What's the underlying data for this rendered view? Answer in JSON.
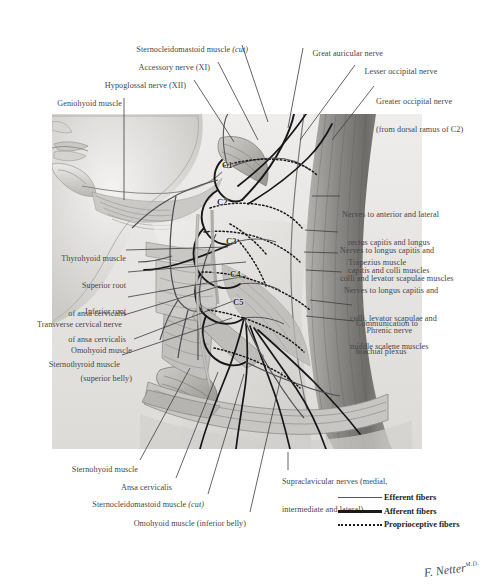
{
  "plate": {
    "title": "Cervical Plexus In Situ",
    "background_color": "#ffffff",
    "text_color": "#46464a",
    "signature": "F. Netter",
    "signature_suffix": "M.D."
  },
  "labels_top_left": [
    {
      "id": "sternocleidomastoid-cut-top",
      "text": "Sternocleidomastoid muscle ",
      "emph": "(cut)"
    },
    {
      "id": "accessory-nerve",
      "text": "Accessory nerve (XI)",
      "emph": ""
    },
    {
      "id": "hypoglossal-nerve",
      "text": "Hypoglossal nerve (XII)",
      "emph": ""
    },
    {
      "id": "geniohyoid-muscle",
      "text": "Geniohyoid muscle",
      "emph": ""
    }
  ],
  "labels_top_right": [
    {
      "id": "great-auricular-nerve",
      "line1": "Great auricular nerve",
      "line2": ""
    },
    {
      "id": "lesser-occipital-nerve",
      "line1": "Lesser occipital nerve",
      "line2": ""
    },
    {
      "id": "greater-occipital-nerve",
      "line1": "Greater occipital nerve",
      "line2": "(from dorsal ramus of C2)"
    }
  ],
  "labels_left": [
    {
      "id": "thyrohyoid-muscle",
      "line1": "Thyrohyoid muscle",
      "line2": "",
      "line3": ""
    },
    {
      "id": "superior-root-ansa-cervicalis",
      "line1": "Superior root",
      "line2": "of ansa cervicalis",
      "line3": ""
    },
    {
      "id": "inferior-root-ansa-cervicalis",
      "line1": "Inferior root",
      "line2": "of ansa cervicalis",
      "line3": ""
    },
    {
      "id": "transverse-cervical-nerve",
      "line1": "Transverse cervical nerve",
      "line2": "",
      "line3": ""
    },
    {
      "id": "omohyoid-superior-belly",
      "line1": "Omohyoid muscle",
      "line2": "(superior belly)",
      "line3": ""
    },
    {
      "id": "sternothyroid-muscle",
      "line1": "Sternothyroid muscle",
      "line2": "",
      "line3": ""
    }
  ],
  "labels_right": [
    {
      "id": "nerves-rectus-capitis-longus",
      "line1": "Nerves to anterior and lateral",
      "line2": "rectus capitis and longus",
      "line3": "capitis and colli muscles"
    },
    {
      "id": "nerves-longus-capitis-levator",
      "line1": "Nerves to longus capitis and",
      "line2": "colli and levator scapulae muscles",
      "line3": ""
    },
    {
      "id": "trapezius-muscle",
      "line1": "Trapezius muscle",
      "line2": "",
      "line3": ""
    },
    {
      "id": "nerves-longus-capitis-scalene",
      "line1": "Nerves to longus capitis and",
      "line2": "colli, levator scapulae and",
      "line3": "middle scalene muscles"
    },
    {
      "id": "communication-brachial-plexus",
      "line1": "Communication to",
      "line2": "brachial plexus",
      "line3": ""
    },
    {
      "id": "phrenic-nerve",
      "line1": "Phrenic nerve",
      "line2": "",
      "line3": ""
    }
  ],
  "labels_bottom_left": [
    {
      "id": "sternohyoid-muscle",
      "text": "Sternohyoid muscle",
      "emph": ""
    },
    {
      "id": "ansa-cervicalis",
      "text": "Ansa cervicalis",
      "emph": ""
    },
    {
      "id": "sternocleidomastoid-cut-bottom",
      "text": "Sternocleidomastoid muscle ",
      "emph": "(cut)"
    },
    {
      "id": "omohyoid-inferior-belly",
      "text": "Omohyoid muscle (inferior belly)",
      "emph": ""
    }
  ],
  "labels_bottom_right": [
    {
      "id": "supraclavicular-nerves",
      "line1": "Supraclavicular nerves (medial,",
      "line2": "intermediate and lateral)"
    }
  ],
  "cervical_levels": [
    {
      "id": "c1",
      "label": "C1"
    },
    {
      "id": "c2",
      "label": "C2"
    },
    {
      "id": "c3",
      "label": "C3"
    },
    {
      "id": "c4",
      "label": "C4"
    },
    {
      "id": "c5",
      "label": "C5"
    }
  ],
  "legend": {
    "items": [
      {
        "id": "efferent",
        "label": "Efferent fibers",
        "style": "thin-line",
        "color": "#55555a"
      },
      {
        "id": "afferent",
        "label": "Afferent fibers",
        "style": "thick-line",
        "color": "#1a1a1a"
      },
      {
        "id": "proprioceptive",
        "label": "Proprioceptive fibers",
        "style": "dotted-line",
        "color": "#1a1a1a"
      }
    ]
  }
}
